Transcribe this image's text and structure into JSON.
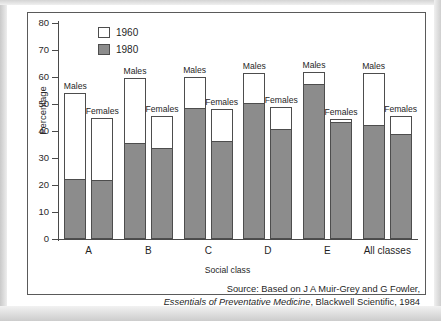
{
  "chart_data": {
    "type": "bar",
    "title": "",
    "subtitle": "",
    "xlabel": "Social class",
    "ylabel": "Percentage",
    "ylim": [
      0,
      80
    ],
    "yticks": [
      0,
      10,
      20,
      30,
      40,
      50,
      60,
      70,
      80
    ],
    "grid": false,
    "legend_position": "top-left",
    "legend": [
      "1960",
      "1980"
    ],
    "categories": [
      "A",
      "B",
      "C",
      "D",
      "E",
      "All classes"
    ],
    "subgroups": [
      "Males",
      "Females"
    ],
    "note": "Overlay bars: white bar height = 1960 percentage (full bar), grey lower portion = 1980 percentage",
    "series": [
      {
        "name": "1960",
        "color": "#ffffff",
        "values_males": [
          54.0,
          59.5,
          60.0,
          61.5,
          62.0,
          61.5
        ],
        "values_females": [
          45.0,
          45.5,
          48.0,
          49.0,
          44.5,
          45.5
        ]
      },
      {
        "name": "1980",
        "color": "#8c8c8c",
        "values_males": [
          22.0,
          35.0,
          48.0,
          50.0,
          57.0,
          42.0
        ],
        "values_females": [
          21.5,
          33.5,
          36.0,
          40.5,
          43.0,
          38.5
        ]
      }
    ],
    "bars": [
      {
        "category": "A",
        "sex": "Males",
        "caption": "Males",
        "v1960": 54.0,
        "v1980": 22.0
      },
      {
        "category": "A",
        "sex": "Females",
        "caption": "Females",
        "v1960": 45.0,
        "v1980": 21.5
      },
      {
        "category": "B",
        "sex": "Males",
        "caption": "Males",
        "v1960": 59.5,
        "v1980": 35.0
      },
      {
        "category": "B",
        "sex": "Females",
        "caption": "Females",
        "v1960": 45.5,
        "v1980": 33.5
      },
      {
        "category": "C",
        "sex": "Males",
        "caption": "Males",
        "v1960": 60.0,
        "v1980": 48.0
      },
      {
        "category": "C",
        "sex": "Females",
        "caption": "Females",
        "v1960": 48.0,
        "v1980": 36.0
      },
      {
        "category": "D",
        "sex": "Males",
        "caption": "Males",
        "v1960": 61.5,
        "v1980": 50.0
      },
      {
        "category": "D",
        "sex": "Females",
        "caption": "Females",
        "v1960": 49.0,
        "v1980": 40.5
      },
      {
        "category": "E",
        "sex": "Males",
        "caption": "Males",
        "v1960": 62.0,
        "v1980": 57.0
      },
      {
        "category": "E",
        "sex": "Females",
        "caption": "Females",
        "v1960": 44.5,
        "v1980": 43.0
      },
      {
        "category": "All classes",
        "sex": "Males",
        "caption": "Males",
        "v1960": 61.5,
        "v1980": 42.0
      },
      {
        "category": "All classes",
        "sex": "Females",
        "caption": "Females",
        "v1960": 45.5,
        "v1980": 38.5
      }
    ]
  },
  "source": {
    "line1": "Source: Based on J A Muir-Grey and G Fowler,",
    "line2_italic": "Essentials of Preventative Medicine",
    "line2_rest": ", Blackwell Scientific, 1984"
  }
}
